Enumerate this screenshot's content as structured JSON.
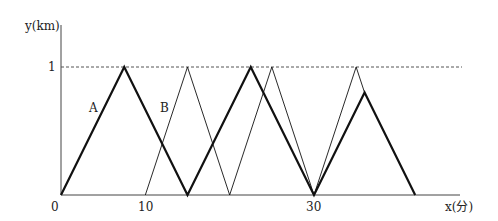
{
  "chart_data": {
    "type": "line",
    "title": "",
    "xlabel": "x(分)",
    "ylabel": "y(km)",
    "xticks": [
      0,
      10,
      30
    ],
    "yticks": [
      1
    ],
    "xlim": [
      0,
      47
    ],
    "ylim": [
      0,
      1.15
    ],
    "grid": false,
    "reference_line": {
      "y": 1,
      "style": "dashed"
    },
    "series": [
      {
        "name": "A",
        "style": "thick",
        "points": [
          [
            0,
            0
          ],
          [
            7.5,
            1
          ],
          [
            15,
            0
          ],
          [
            22.5,
            1
          ],
          [
            30,
            0
          ],
          [
            36,
            0.8
          ],
          [
            42,
            0
          ]
        ]
      },
      {
        "name": "B",
        "style": "thin",
        "points": [
          [
            10,
            0
          ],
          [
            15,
            1
          ],
          [
            20,
            0
          ],
          [
            25,
            1
          ],
          [
            30,
            0
          ],
          [
            35,
            1
          ],
          [
            36,
            0.8
          ]
        ]
      }
    ],
    "annotations": [
      {
        "text": "A",
        "x": 4.2,
        "y": 0.55
      },
      {
        "text": "B",
        "x": 12.3,
        "y": 0.55
      }
    ]
  },
  "labels": {
    "y_axis": "y(km)",
    "x_axis": "x(分)",
    "origin": "0",
    "x10": "10",
    "x30": "30",
    "y1": "1",
    "A": "A",
    "B": "B"
  }
}
